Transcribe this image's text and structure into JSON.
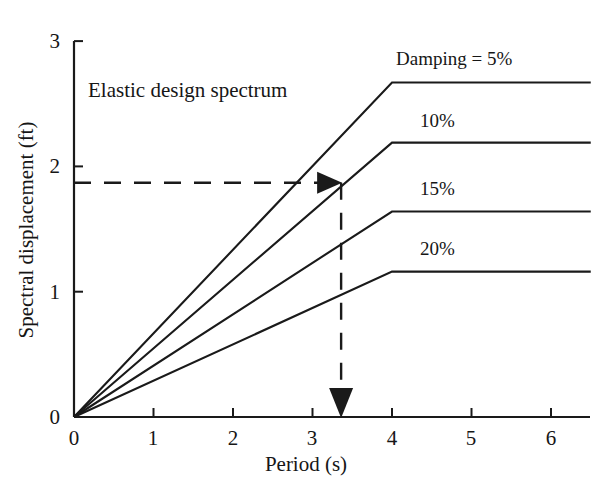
{
  "chart_data": {
    "type": "line",
    "title": "",
    "annotation": "Elastic design spectrum",
    "xlabel": "Period (s)",
    "ylabel": "Spectral displacement (ft)",
    "xlim": [
      0,
      6.5
    ],
    "ylim": [
      0,
      3
    ],
    "xticks": [
      "0",
      "1",
      "2",
      "3",
      "4",
      "5",
      "6"
    ],
    "xtick_values": [
      0,
      1,
      2,
      3,
      4,
      5,
      6
    ],
    "yticks": [
      "0",
      "1",
      "2",
      "3"
    ],
    "ytick_values": [
      0,
      1,
      2,
      3
    ],
    "grid": false,
    "legend_position": "inline-right",
    "series": [
      {
        "name": "Damping = 5%",
        "label": "Damping = 5%",
        "label_x": 4.05,
        "label_y": 2.92,
        "x": [
          0,
          4,
          6.5
        ],
        "y": [
          0,
          2.67,
          2.67
        ]
      },
      {
        "name": "10%",
        "label": "10%",
        "label_x": 4.35,
        "label_y": 2.42,
        "x": [
          0,
          4,
          6.5
        ],
        "y": [
          0,
          2.19,
          2.19
        ]
      },
      {
        "name": "15%",
        "label": "15%",
        "label_x": 4.35,
        "label_y": 1.88,
        "x": [
          0,
          4,
          6.5
        ],
        "y": [
          0,
          1.64,
          1.64
        ]
      },
      {
        "name": "20%",
        "label": "20%",
        "label_x": 4.35,
        "label_y": 1.4,
        "x": [
          0,
          4,
          6.5
        ],
        "y": [
          0,
          1.16,
          1.16
        ]
      }
    ],
    "guides": {
      "horizontal_dashed": {
        "y_value": 1.87,
        "x_from": 0,
        "x_to": 3.36,
        "arrow": "right",
        "style": "dashed"
      },
      "vertical_dashed": {
        "x_value": 3.36,
        "y_from": 1.87,
        "y_to": 0,
        "arrow": "down",
        "style": "dashed"
      }
    },
    "colors": {
      "line": "#1a1a1a",
      "axis": "#1a1a1a",
      "text": "#161616",
      "background": "#ffffff"
    }
  },
  "geometry": {
    "origin_x": 74,
    "origin_y": 417,
    "x_unit_px": 79.5,
    "y_unit_px": 125.3,
    "top_y": 41,
    "right_x": 590
  }
}
